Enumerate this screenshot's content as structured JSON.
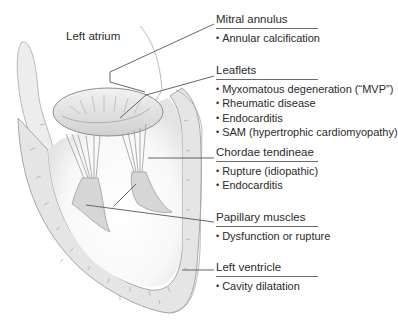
{
  "figure": {
    "region_label": "Left atrium",
    "callouts": [
      {
        "id": "mitral-annulus",
        "heading": "Mitral annulus",
        "items": [
          "Annular calcification"
        ]
      },
      {
        "id": "leaflets",
        "heading": "Leaflets",
        "items": [
          "Myxomatous degeneration (“MVP”)",
          "Rheumatic disease",
          "Endocarditis",
          "SAM (hypertrophic cardiomyopathy)"
        ]
      },
      {
        "id": "chordae-tendineae",
        "heading": "Chordae tendineae",
        "items": [
          "Rupture (idiopathic)",
          "Endocarditis"
        ]
      },
      {
        "id": "papillary-muscles",
        "heading": "Papillary muscles",
        "items": [
          "Dysfunction or rupture"
        ]
      },
      {
        "id": "left-ventricle",
        "heading": "Left ventricle",
        "items": [
          "Cavity dilatation"
        ]
      }
    ]
  },
  "colors": {
    "tissue": "#e6e6e6",
    "tissue_dark": "#cfcfcf",
    "outline": "#9a9a9a",
    "leader": "#555555",
    "text": "#2b2b2b"
  }
}
